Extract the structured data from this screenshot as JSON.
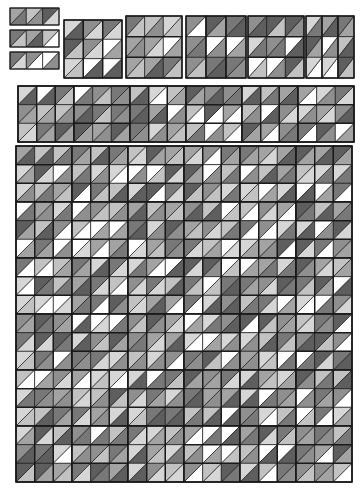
{
  "figure": {
    "type": "tiling-diagram",
    "background": "#ffffff",
    "stroke": "#1a1a1a",
    "stroke_width": 0.7,
    "canvas": {
      "width": 362,
      "height": 497
    }
  },
  "palette": {
    "white": "#ffffff",
    "light": "#d6d6d6",
    "light2": "#c2c2c2",
    "medium": "#a3a3a3",
    "medium2": "#8f8f8f",
    "dark": "#787878",
    "darker": "#5e5e5e",
    "outline": "#1a1a1a"
  },
  "geometry": {
    "cell": 15.3,
    "strip_cells": 3,
    "block_cols": 3,
    "block_rows": 3,
    "block_w": 46,
    "block_h": 46,
    "gap": 2
  },
  "stages": [
    {
      "name": "stage-1-strips",
      "label": "level 1 strips",
      "x": 10,
      "y": 8,
      "cols": 1,
      "rows": 3,
      "orientation": "horizontal",
      "block_w": 48,
      "block_h": 16
    },
    {
      "name": "stage-2-block-a",
      "label": "level 2 block",
      "x": 64,
      "y": 20,
      "cols": 1,
      "rows": 1,
      "orientation": "vertical",
      "block_w": 58,
      "block_h": 58
    },
    {
      "name": "stage-2-block-b",
      "label": "level 2 block",
      "x": 126,
      "y": 16,
      "cols": 1,
      "rows": 1,
      "orientation": "horizontal",
      "block_w": 56,
      "block_h": 62
    },
    {
      "name": "stage-2-row",
      "label": "level 2 row",
      "x": 186,
      "y": 16,
      "cols": 3,
      "rows": 1,
      "orientation": "mixed",
      "block_w": 56,
      "block_h": 62
    },
    {
      "name": "stage-3-band",
      "label": "level 3 band",
      "x": 18,
      "y": 86,
      "cols": 6,
      "rows": 1,
      "orientation": "mixed",
      "block_w": 56,
      "block_h": 56
    },
    {
      "name": "stage-4-grid",
      "label": "level 4 grid",
      "x": 16,
      "y": 146,
      "cols": 6,
      "rows": 6,
      "orientation": "mixed",
      "block_w": 56,
      "block_h": 56
    }
  ],
  "tile_kinds": [
    {
      "name": "up-triangle",
      "glyph": "▲"
    },
    {
      "name": "down-triangle",
      "glyph": "▼"
    },
    {
      "name": "left-triangle",
      "glyph": "◀"
    },
    {
      "name": "right-triangle",
      "glyph": "▶"
    }
  ],
  "chart_data": {
    "type": "heatmap",
    "legend": [],
    "categories": [
      "white",
      "light",
      "light2",
      "medium",
      "medium2",
      "dark",
      "darker"
    ],
    "values": [
      6,
      5,
      4,
      3,
      2,
      1,
      0
    ],
    "note": "Grayscale triangular substitution tiling; each square cell is split by a diagonal into two triangles, shaded from a 7-level gray palette."
  }
}
